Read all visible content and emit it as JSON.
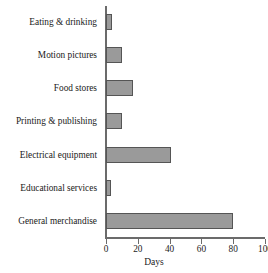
{
  "chart_data": {
    "type": "bar",
    "orientation": "horizontal",
    "title": "",
    "xlabel": "Days",
    "ylabel": "",
    "categories": [
      "Eating & drinking",
      "Motion pictures",
      "Food stores",
      "Printing & publishing",
      "Electrical equipment",
      "Educational services",
      "General merchandise"
    ],
    "values": [
      4,
      10,
      17,
      10,
      41,
      3,
      80
    ],
    "xlim": [
      0,
      100
    ],
    "xticks": [
      0,
      20,
      40,
      60,
      80,
      100
    ],
    "xtick_labels": [
      "0",
      "20",
      "40",
      "60",
      "80",
      "100"
    ],
    "grid": false,
    "legend": false,
    "bar_fill_color": "#9a9a9a",
    "bar_edge_color": "#555555",
    "axis_color": "#6b6b6b",
    "text_color": "#1a1a1a",
    "background_color": "#ffffff"
  }
}
